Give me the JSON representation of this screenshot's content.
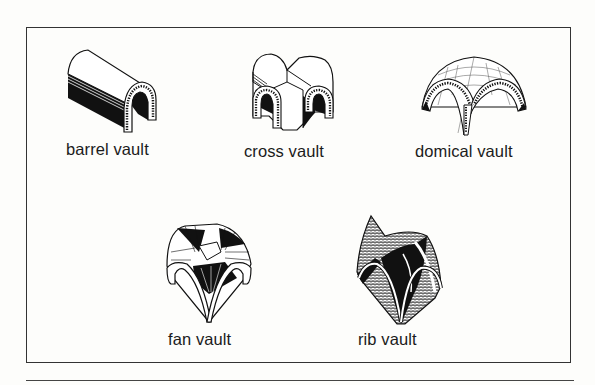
{
  "figure": {
    "items": [
      {
        "id": "barrel",
        "label": "barrel vault"
      },
      {
        "id": "cross",
        "label": "cross vault"
      },
      {
        "id": "domical",
        "label": "domical vault"
      },
      {
        "id": "fan",
        "label": "fan vault"
      },
      {
        "id": "rib",
        "label": "rib vault"
      }
    ]
  },
  "colors": {
    "ink": "#1a1a1a",
    "paper": "#fdfdfb",
    "frame": "#333333"
  }
}
